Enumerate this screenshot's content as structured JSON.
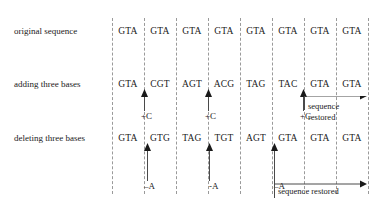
{
  "figure": {
    "rows": [
      {
        "label": "original sequence",
        "label_y": 26,
        "codon_y": 25,
        "codons": [
          "GTA",
          "GTA",
          "GTA",
          "GTA",
          "GTA",
          "GTA",
          "GTA",
          "GTA"
        ]
      },
      {
        "label": "adding three bases",
        "label_y": 79,
        "codon_y": 78,
        "codons": [
          "GTA",
          "CGT",
          "AGT",
          "ACG",
          "TAG",
          "TAC",
          "GTA",
          "GTA"
        ]
      },
      {
        "label": "deleting three bases",
        "label_y": 133,
        "codon_y": 132,
        "codons": [
          "GTA",
          "GTG",
          "TAG",
          "TGT",
          "AGT",
          "GTA",
          "GTA",
          "GTA"
        ]
      }
    ],
    "insertion_marks": [
      {
        "label": "+C",
        "x": 141,
        "y": 111,
        "arrow_x": 144,
        "arrow_top": 89,
        "arrow_height": 22
      },
      {
        "label": "+C",
        "x": 205,
        "y": 111,
        "arrow_x": 208,
        "arrow_top": 89,
        "arrow_height": 22
      },
      {
        "label": "+C",
        "x": 300,
        "y": 111,
        "arrow_x": 303,
        "arrow_top": 89,
        "arrow_height": 22
      }
    ],
    "deletion_marks": [
      {
        "label": "–A",
        "x": 144,
        "y": 181,
        "arrow_x": 147,
        "arrow_top": 143,
        "arrow_height": 38
      },
      {
        "label": "-A",
        "x": 209,
        "y": 181,
        "arrow_x": 209,
        "arrow_top": 143,
        "arrow_height": 38
      },
      {
        "label": "–A",
        "x": 274,
        "y": 181,
        "arrow_x": 274,
        "arrow_top": 143,
        "arrow_height": 38
      }
    ],
    "restored_spans": [
      {
        "id": "adding-restored",
        "label_line1": "sequence",
        "label_line2": "restored",
        "bar_x": 304,
        "bar_y": 96,
        "bar_width": 63,
        "tick_top": 96,
        "tick_height": 22,
        "label_x": 308,
        "label_y": 101
      },
      {
        "id": "deleting-restored",
        "label_line1": "sequence restored",
        "label_line2": "",
        "bar_x": 274,
        "bar_y": 184,
        "bar_width": 93,
        "tick_top": 168,
        "tick_height": 16,
        "label_x": 278,
        "label_y": 186
      }
    ],
    "grid": {
      "first_x": 112,
      "spacing": 32,
      "count": 9
    },
    "colors": {
      "ink": "#1a1a1a",
      "dash": "#9a9a9a",
      "background": "#ffffff"
    }
  }
}
